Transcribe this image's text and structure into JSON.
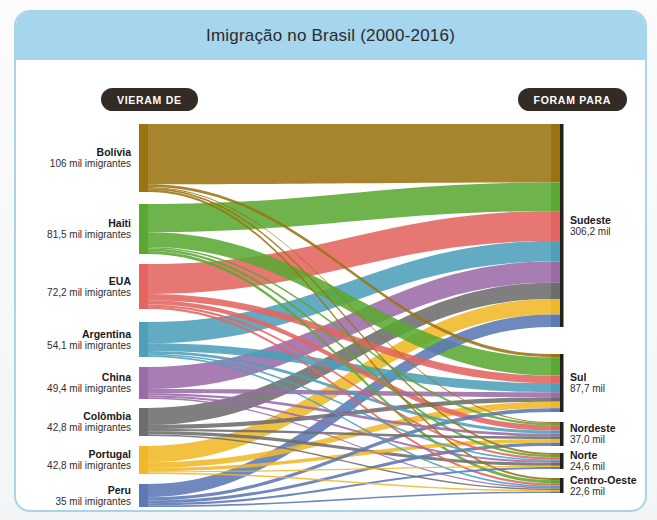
{
  "credit": "HERBERT TSUJI",
  "header": {
    "title": "Imigração no Brasil (2000-2016)",
    "source_pill": "VIERAM DE",
    "target_pill": "FORAM PARA"
  },
  "unit_source": "mil imigrantes",
  "unit_target": "mil",
  "chart_data": {
    "type": "sankey",
    "title": "Imigração no Brasil (2000-2016)",
    "xlabel": "",
    "ylabel": "",
    "grid": false,
    "legend": "none",
    "units": "mil (milhares de imigrantes)",
    "nodes_left": [
      {
        "id": "bolivia",
        "label": "Bolívia",
        "value": 106.0,
        "value_text": "106 mil imigrantes",
        "color": "#9a7411"
      },
      {
        "id": "haiti",
        "label": "Haiti",
        "value": 81.5,
        "value_text": "81,5 mil imigrantes",
        "color": "#5aa832"
      },
      {
        "id": "eua",
        "label": "EUA",
        "value": 72.2,
        "value_text": "72,2 mil imigrantes",
        "color": "#e4645f"
      },
      {
        "id": "argentina",
        "label": "Argentina",
        "value": 54.1,
        "value_text": "54,1 mil imigrantes",
        "color": "#4d9fba"
      },
      {
        "id": "china",
        "label": "China",
        "value": 49.4,
        "value_text": "49,4 mil imigrantes",
        "color": "#9b6ba8"
      },
      {
        "id": "colombia",
        "label": "Colômbia",
        "value": 42.8,
        "value_text": "42,8 mil imigrantes",
        "color": "#6d6d6d"
      },
      {
        "id": "portugal",
        "label": "Portugal",
        "value": 42.8,
        "value_text": "42,8 mil imigrantes",
        "color": "#f0b828"
      },
      {
        "id": "peru",
        "label": "Peru",
        "value": 35.0,
        "value_text": "35 mil imigrantes",
        "color": "#5b79b5"
      }
    ],
    "nodes_right": [
      {
        "id": "sudeste",
        "label": "Sudeste",
        "value": 306.2,
        "value_text": "306,2 mil"
      },
      {
        "id": "sul",
        "label": "Sul",
        "value": 87.7,
        "value_text": "87,7 mil"
      },
      {
        "id": "nordeste",
        "label": "Nordeste",
        "value": 37.0,
        "value_text": "37,0 mil"
      },
      {
        "id": "norte",
        "label": "Norte",
        "value": 24.6,
        "value_text": "24,6 mil"
      },
      {
        "id": "centro-oeste",
        "label": "Centro-Oeste",
        "value": 22.6,
        "value_text": "22,6 mil"
      }
    ],
    "links": [
      {
        "source": "bolivia",
        "target": "sudeste",
        "value": 94.0
      },
      {
        "source": "bolivia",
        "target": "sul",
        "value": 4.2
      },
      {
        "source": "bolivia",
        "target": "centro-oeste",
        "value": 3.4
      },
      {
        "source": "bolivia",
        "target": "norte",
        "value": 3.0
      },
      {
        "source": "bolivia",
        "target": "nordeste",
        "value": 1.4
      },
      {
        "source": "haiti",
        "target": "sudeste",
        "value": 46.0
      },
      {
        "source": "haiti",
        "target": "sul",
        "value": 24.0
      },
      {
        "source": "haiti",
        "target": "centro-oeste",
        "value": 5.0
      },
      {
        "source": "haiti",
        "target": "norte",
        "value": 3.8
      },
      {
        "source": "haiti",
        "target": "nordeste",
        "value": 2.7
      },
      {
        "source": "eua",
        "target": "sudeste",
        "value": 48.0
      },
      {
        "source": "eua",
        "target": "sul",
        "value": 10.0
      },
      {
        "source": "eua",
        "target": "nordeste",
        "value": 7.0
      },
      {
        "source": "eua",
        "target": "centro-oeste",
        "value": 3.8
      },
      {
        "source": "eua",
        "target": "norte",
        "value": 3.4
      },
      {
        "source": "argentina",
        "target": "sudeste",
        "value": 33.0
      },
      {
        "source": "argentina",
        "target": "sul",
        "value": 12.0
      },
      {
        "source": "argentina",
        "target": "nordeste",
        "value": 4.0
      },
      {
        "source": "argentina",
        "target": "centro-oeste",
        "value": 2.7
      },
      {
        "source": "argentina",
        "target": "norte",
        "value": 2.4
      },
      {
        "source": "china",
        "target": "sudeste",
        "value": 34.0
      },
      {
        "source": "china",
        "target": "sul",
        "value": 6.5
      },
      {
        "source": "china",
        "target": "nordeste",
        "value": 3.6
      },
      {
        "source": "china",
        "target": "norte",
        "value": 3.1
      },
      {
        "source": "china",
        "target": "centro-oeste",
        "value": 2.2
      },
      {
        "source": "colombia",
        "target": "sudeste",
        "value": 26.0
      },
      {
        "source": "colombia",
        "target": "sul",
        "value": 6.0
      },
      {
        "source": "colombia",
        "target": "norte",
        "value": 5.0
      },
      {
        "source": "colombia",
        "target": "nordeste",
        "value": 3.4
      },
      {
        "source": "colombia",
        "target": "centro-oeste",
        "value": 2.4
      },
      {
        "source": "portugal",
        "target": "sudeste",
        "value": 25.0
      },
      {
        "source": "portugal",
        "target": "sul",
        "value": 8.5
      },
      {
        "source": "portugal",
        "target": "nordeste",
        "value": 5.0
      },
      {
        "source": "portugal",
        "target": "centro-oeste",
        "value": 2.4
      },
      {
        "source": "portugal",
        "target": "norte",
        "value": 1.9
      },
      {
        "source": "peru",
        "target": "sudeste",
        "value": 20.0
      },
      {
        "source": "peru",
        "target": "sul",
        "value": 5.0
      },
      {
        "source": "peru",
        "target": "nordeste",
        "value": 4.2
      },
      {
        "source": "peru",
        "target": "norte",
        "value": 3.2
      },
      {
        "source": "peru",
        "target": "centro-oeste",
        "value": 2.6
      }
    ]
  }
}
